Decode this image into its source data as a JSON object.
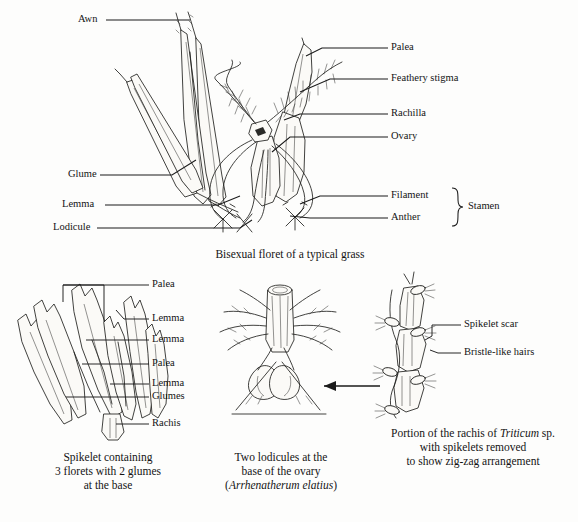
{
  "figure": {
    "background_color": "#fdfdfc",
    "ink_color": "#1b1b1b"
  },
  "panels": [
    {
      "id": "bisexual-floret",
      "caption": "Bisexual floret of a typical grass",
      "labels_left": [
        {
          "text": "Awn",
          "x": 78,
          "y": 20
        },
        {
          "text": "Glume",
          "x": 68,
          "y": 175
        },
        {
          "text": "Lemma",
          "x": 62,
          "y": 205
        },
        {
          "text": "Lodicule",
          "x": 53,
          "y": 228
        }
      ],
      "labels_right": [
        {
          "text": "Palea",
          "x": 391,
          "y": 48
        },
        {
          "text": "Feathery stigma",
          "x": 391,
          "y": 79
        },
        {
          "text": "Rachilla",
          "x": 391,
          "y": 114
        },
        {
          "text": "Ovary",
          "x": 391,
          "y": 137
        },
        {
          "text": "Filament",
          "x": 391,
          "y": 196
        },
        {
          "text": "Anther",
          "x": 391,
          "y": 218
        }
      ],
      "bracket_label": {
        "text": "Stamen",
        "x": 470,
        "y": 207
      }
    },
    {
      "id": "spikelet",
      "caption_lines": [
        "Spikelet containing",
        "3 florets with 2 glumes",
        "at the base"
      ],
      "labels": [
        {
          "text": "Palea",
          "x": 152,
          "y": 285
        },
        {
          "text": "Lemma",
          "x": 152,
          "y": 319
        },
        {
          "text": "Lemma",
          "x": 152,
          "y": 340
        },
        {
          "text": "Palea",
          "x": 152,
          "y": 364
        },
        {
          "text": "Lemma",
          "x": 152,
          "y": 384
        },
        {
          "text": "Glumes",
          "x": 152,
          "y": 397
        },
        {
          "text": "Rachis",
          "x": 152,
          "y": 424
        }
      ]
    },
    {
      "id": "lodicules",
      "caption_lines": [
        "Two lodicules at the",
        "base of the ovary"
      ],
      "caption_species": "Arrhenatherum elatius",
      "caption_species_open": "(",
      "caption_species_close": ")",
      "has_pointer_arrow": true
    },
    {
      "id": "rachis-triticum",
      "caption_prefix": "Portion of the rachis of ",
      "caption_species": "Triticum",
      "caption_suffix": " sp.",
      "caption_line2": "with spikelets removed",
      "caption_line3": "to show zig-zag arrangement",
      "labels": [
        {
          "text": "Spikelet scar",
          "x": 464,
          "y": 325
        },
        {
          "text": "Bristle-like hairs",
          "x": 464,
          "y": 353
        }
      ]
    }
  ]
}
